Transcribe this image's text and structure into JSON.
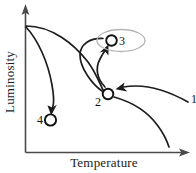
{
  "figure": {
    "type": "diagram",
    "background_color": "#ffffff"
  },
  "axes": {
    "x_label": "Temperature",
    "y_label": "Luminosity",
    "axis_color": "#4a4a4a",
    "x_arrow": "arrow-right",
    "y_arrow": "arrow-up",
    "ticks": []
  },
  "markers": [
    {
      "id": "m1",
      "label": "1",
      "kind": "label-only",
      "note": "curve endpoint at right edge"
    },
    {
      "id": "m2",
      "label": "2",
      "kind": "open-circle"
    },
    {
      "id": "m3",
      "label": "3",
      "kind": "open-circle",
      "highlighted": true
    },
    {
      "id": "m4",
      "label": "4",
      "kind": "open-circle"
    }
  ],
  "highlight": {
    "shape": "ellipse",
    "color": "#b4b4b4",
    "target": "3"
  },
  "curve_color": "#1c1c1c",
  "marker_stroke": "#111111"
}
